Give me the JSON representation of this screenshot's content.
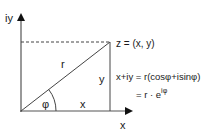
{
  "diagram": {
    "axes": {
      "y_label": "iy",
      "x_label": "x"
    },
    "triangle": {
      "hypotenuse_label": "r",
      "angle_label": "φ",
      "adjacent_label": "x",
      "opposite_label": "y"
    },
    "point_label": "z = (x, y)",
    "equations": {
      "line1": "x+iy = r(cosφ+isinφ)",
      "line2_prefix": "= r · e",
      "line2_exponent": "iφ"
    },
    "colors": {
      "line": "#333333",
      "axis": "#555555",
      "text": "#1a1a1a"
    }
  }
}
